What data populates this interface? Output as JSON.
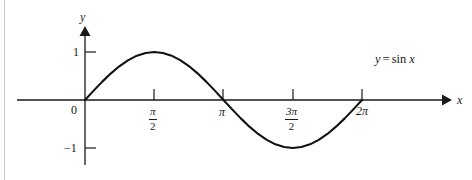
{
  "figure": {
    "title_equation": {
      "lhs": "y",
      "operator": "=",
      "function": "sin",
      "argument": "x"
    },
    "axes": {
      "x_label": "x",
      "y_label": "y",
      "origin_label": "0"
    },
    "y_ticks": [
      {
        "label": "1",
        "value": 1
      },
      {
        "label": "−1",
        "value": -1
      }
    ],
    "x_ticks": [
      {
        "label": "0",
        "numerator": "",
        "denominator": "",
        "value": 0,
        "kind": "plain"
      },
      {
        "label": "",
        "numerator": "π",
        "denominator": "2",
        "value": 1.5708,
        "kind": "fraction"
      },
      {
        "label": "π",
        "numerator": "",
        "denominator": "",
        "value": 3.1416,
        "kind": "plain"
      },
      {
        "label": "",
        "numerator": "3π",
        "denominator": "2",
        "value": 4.7124,
        "kind": "fraction"
      },
      {
        "label": "2π",
        "numerator": "",
        "denominator": "",
        "value": 6.2832,
        "kind": "plain"
      }
    ],
    "colors": {
      "curve": "#111111",
      "axis": "#1a1a1a",
      "text": "#1a1a1a",
      "background": "#ffffff",
      "edge_rule": "#c9c9c9"
    }
  },
  "chart_data": {
    "type": "line",
    "xlabel": "x",
    "ylabel": "y",
    "xlim": [
      -1.0,
      7.55
    ],
    "ylim": [
      -1.45,
      1.55
    ],
    "grid": false,
    "legend": "none",
    "annotations": [
      {
        "text": "y = sin x",
        "x": 6.6,
        "y": 1.05
      }
    ],
    "xticks": [
      0,
      1.5708,
      3.1416,
      4.7124,
      6.2832
    ],
    "xticklabels": [
      "0",
      "π/2",
      "π",
      "3π/2",
      "2π"
    ],
    "yticks": [
      -1,
      1
    ],
    "yticklabels": [
      "−1",
      "1"
    ],
    "series": [
      {
        "name": "sin x",
        "x": [
          0,
          0.1963,
          0.3927,
          0.589,
          0.7854,
          0.9817,
          1.1781,
          1.3744,
          1.5708,
          1.7671,
          1.9635,
          2.1598,
          2.3562,
          2.5525,
          2.7489,
          2.9452,
          3.1416,
          3.3379,
          3.5343,
          3.7306,
          3.927,
          4.1233,
          4.3197,
          4.516,
          4.7124,
          4.9087,
          5.1051,
          5.3014,
          5.4978,
          5.6941,
          5.8905,
          6.0868,
          6.2832
        ],
        "y": [
          0,
          0.1951,
          0.3827,
          0.5556,
          0.7071,
          0.8315,
          0.9239,
          0.9808,
          1.0,
          0.9808,
          0.9239,
          0.8315,
          0.7071,
          0.5556,
          0.3827,
          0.1951,
          0.0,
          -0.1951,
          -0.3827,
          -0.5556,
          -0.7071,
          -0.8315,
          -0.9239,
          -0.9808,
          -1.0,
          -0.9808,
          -0.9239,
          -0.8315,
          -0.7071,
          -0.5556,
          -0.3827,
          -0.1951,
          0.0
        ]
      }
    ]
  }
}
